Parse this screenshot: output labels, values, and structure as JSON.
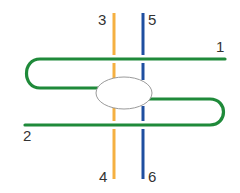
{
  "diagram": {
    "colors": {
      "strand_green": "#1f8a3a",
      "strand_orange": "#f5b041",
      "strand_blue": "#1f4fa0",
      "ellipse_stroke": "#9a9a9a",
      "ellipse_fill": "#ffffff",
      "label": "#333333"
    },
    "labels": {
      "l1": "1",
      "l2": "2",
      "l3": "3",
      "l4": "4",
      "l5": "5",
      "l6": "6"
    }
  }
}
